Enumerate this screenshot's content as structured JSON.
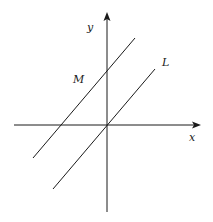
{
  "diagram": {
    "type": "coordinate-plane",
    "axes": {
      "x": {
        "label": "x"
      },
      "y": {
        "label": "y"
      }
    },
    "lines": [
      {
        "name": "L",
        "label": "L",
        "passes_through_origin": true
      },
      {
        "name": "M",
        "label": "M",
        "passes_through_origin": false
      }
    ],
    "colors": {
      "stroke": "#1a1a1a",
      "background": "#ffffff"
    }
  }
}
